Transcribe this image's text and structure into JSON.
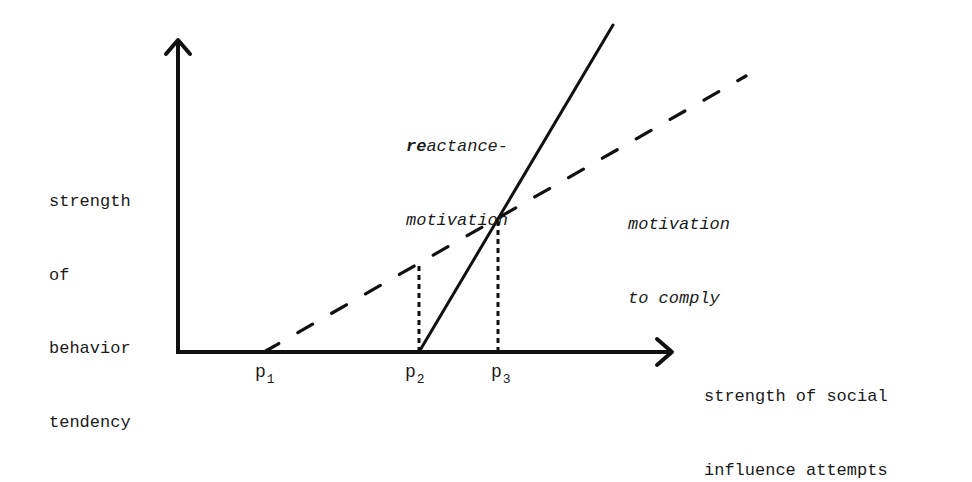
{
  "diagram": {
    "y_axis_label": [
      "strength",
      "of",
      "behavior",
      "tendency"
    ],
    "x_axis_label": [
      "strength of social",
      "influence attempts"
    ],
    "curves": {
      "reactance": {
        "label_line1_bold_prefix": "re",
        "label_line1_rest": "actance-",
        "label_line2": "motivation",
        "style": "solid"
      },
      "comply": {
        "label_line1": "motivation",
        "label_line2": "to comply",
        "style": "dashed"
      }
    },
    "ticks": [
      {
        "base": "p",
        "sub": "1"
      },
      {
        "base": "p",
        "sub": "2"
      },
      {
        "base": "p",
        "sub": "3"
      }
    ],
    "colors": {
      "ink": "#1a1a1a",
      "background": "#ffffff"
    }
  }
}
